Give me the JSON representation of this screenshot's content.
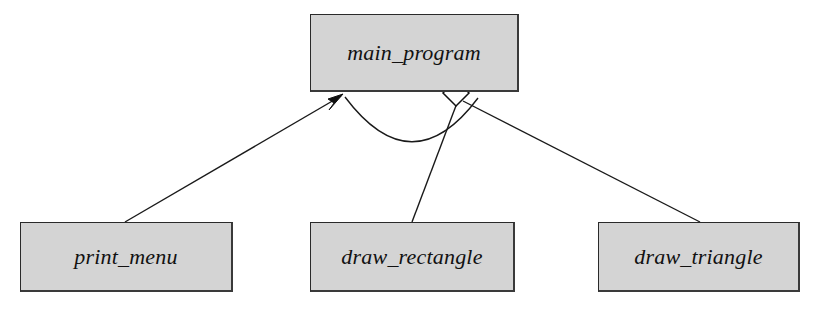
{
  "diagram": {
    "type": "uml-structure-chart",
    "title_text": "",
    "background_color": "#ffffff",
    "node_fill_color": "#d4d4d4",
    "node_border_color": "#2a2a2a",
    "line_color": "#1a1a1a",
    "nodes": [
      {
        "id": "main_program",
        "label": "main_program",
        "role": "root-module",
        "x": 310,
        "y": 14,
        "width": 209,
        "height": 78
      },
      {
        "id": "print_menu",
        "label": "print_menu",
        "role": "child-module",
        "x": 20,
        "y": 222,
        "width": 213,
        "height": 70
      },
      {
        "id": "draw_rectangle",
        "label": "draw_rectangle",
        "role": "child-module",
        "x": 310,
        "y": 222,
        "width": 205,
        "height": 70
      },
      {
        "id": "draw_triangle",
        "label": "draw_triangle",
        "role": "child-module",
        "x": 598,
        "y": 222,
        "width": 202,
        "height": 70
      }
    ],
    "connectors": [
      {
        "id": "print-menu-to-main",
        "from": "print_menu",
        "to": "main_program",
        "marker": "filled-arrowhead",
        "marker_x": 341,
        "marker_y": 95,
        "path": "M 125 222 L 341 96"
      },
      {
        "id": "main-to-draw-rectangle",
        "from": "main_program",
        "to": "draw_rectangle",
        "marker": "open-diamond",
        "marker_x": 456,
        "marker_y": 93,
        "path": "M 457 103 L 412 222"
      },
      {
        "id": "main-to-draw-triangle",
        "from": "main_program",
        "to": "draw_triangle",
        "marker": "open-diamond",
        "marker_x": 456,
        "marker_y": 93,
        "path": "M 463 101 L 700 222"
      },
      {
        "id": "control-flow-arc",
        "from": "main_program",
        "to": "main_program",
        "marker": "none",
        "path": "M 345 97 Q 412 186 478 98"
      }
    ]
  }
}
